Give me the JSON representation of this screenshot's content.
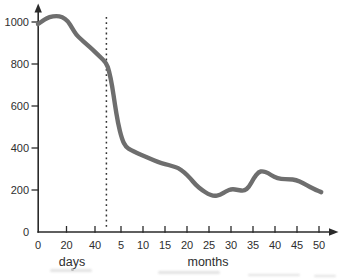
{
  "chart_data": {
    "type": "line",
    "title": "",
    "ylabel": "",
    "xlabel_days": "days",
    "xlabel_months": "months",
    "y_ticks": [
      0,
      200,
      400,
      600,
      800,
      1000
    ],
    "x_ticks_days": [
      0,
      20,
      40
    ],
    "x_ticks_months": [
      5,
      10,
      15,
      20,
      25,
      30,
      35,
      40,
      45,
      50
    ],
    "ylim": [
      0,
      1080
    ],
    "grid": "off",
    "legend": "none",
    "scale_break_vline": {
      "style": "dotted",
      "at_days": 48
    },
    "series": [
      {
        "name": "days-segment",
        "x_axis": "days",
        "points": [
          [
            0,
            990
          ],
          [
            4,
            1010
          ],
          [
            8,
            1024
          ],
          [
            13,
            1029
          ],
          [
            17,
            1024
          ],
          [
            21,
            1005
          ],
          [
            24,
            971
          ],
          [
            27,
            938
          ],
          [
            30,
            919
          ],
          [
            34,
            895
          ],
          [
            38,
            871
          ],
          [
            43,
            838
          ],
          [
            48,
            805
          ]
        ]
      },
      {
        "name": "months-segment",
        "x_axis": "months",
        "points": [
          [
            2.3,
            767
          ],
          [
            3.0,
            695
          ],
          [
            3.6,
            610
          ],
          [
            4.3,
            519
          ],
          [
            5.2,
            443
          ],
          [
            6.1,
            405
          ],
          [
            7.3,
            390
          ],
          [
            8.6,
            376
          ],
          [
            10.2,
            362
          ],
          [
            11.8,
            348
          ],
          [
            13.4,
            333
          ],
          [
            15.0,
            324
          ],
          [
            16.6,
            314
          ],
          [
            18.0,
            305
          ],
          [
            19.3,
            286
          ],
          [
            20.7,
            257
          ],
          [
            22.0,
            224
          ],
          [
            23.4,
            200
          ],
          [
            24.8,
            181
          ],
          [
            26.1,
            171
          ],
          [
            27.5,
            176
          ],
          [
            28.9,
            195
          ],
          [
            30.2,
            205
          ],
          [
            31.6,
            200
          ],
          [
            33.0,
            195
          ],
          [
            34.1,
            214
          ],
          [
            35.2,
            257
          ],
          [
            36.3,
            286
          ],
          [
            37.2,
            290
          ],
          [
            38.4,
            281
          ],
          [
            39.8,
            262
          ],
          [
            41.4,
            252
          ],
          [
            43.2,
            252
          ],
          [
            44.8,
            248
          ],
          [
            46.4,
            233
          ],
          [
            48.0,
            214
          ],
          [
            49.3,
            200
          ],
          [
            50.5,
            190
          ]
        ]
      }
    ],
    "colors": {
      "curve": "#6e6e6e",
      "axis": "#2a2a2a",
      "dotted_line": "#323232",
      "text": "#2e2e2e",
      "background": "#ffffff"
    }
  }
}
